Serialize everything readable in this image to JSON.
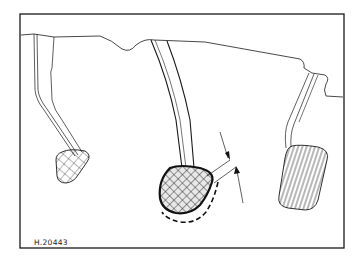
{
  "figure": {
    "reference_code": "H.20443",
    "elements": {
      "left_pedal": "clutch-pedal",
      "center_pedal": "brake-pedal",
      "right_pedal": "accelerator-pedal",
      "callout": "dimension-arrows",
      "dashed_outline": "brake-pedal-displaced-position"
    },
    "colors": {
      "line": "#1a1a1a",
      "background": "#ffffff"
    }
  }
}
